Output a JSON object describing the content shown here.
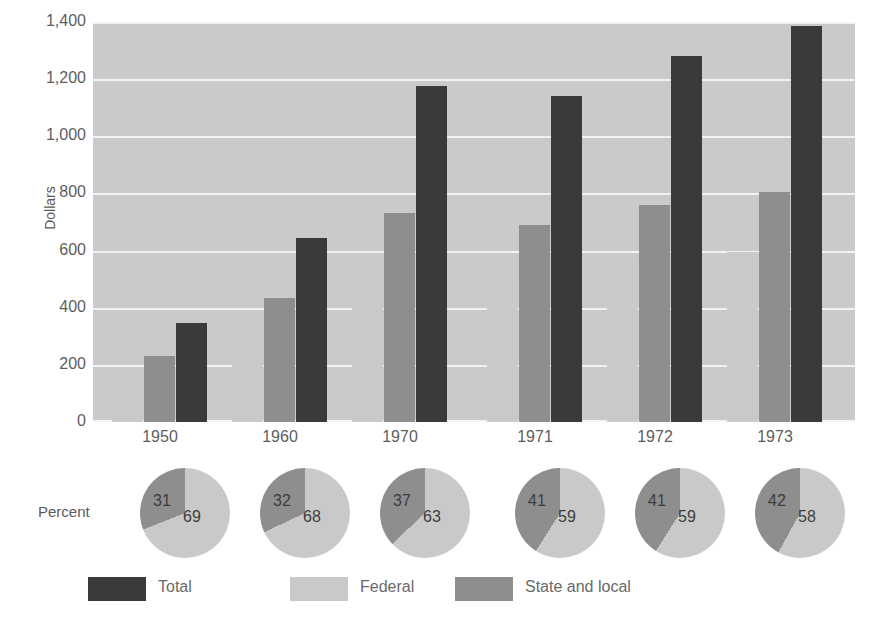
{
  "chart_data": {
    "type": "bar",
    "title": "",
    "xlabel": "",
    "ylabel": "Dollars",
    "ylim": [
      0,
      1400
    ],
    "yticks": [
      "0",
      "200",
      "400",
      "600",
      "800",
      "1,000",
      "1,200",
      "1,400"
    ],
    "ytick_values": [
      0,
      200,
      400,
      600,
      800,
      1000,
      1200,
      1400
    ],
    "grid": true,
    "legend_position": "bottom",
    "categories": [
      "1950",
      "1960",
      "1970",
      "1971",
      "1972",
      "1973"
    ],
    "series": [
      {
        "name": "Federal",
        "color": "#c9c9c9",
        "values": [
          120,
          205,
          440,
          480,
          535,
          595
        ]
      },
      {
        "name": "State and local",
        "color": "#8e8e8e",
        "values": [
          230,
          435,
          730,
          690,
          760,
          805
        ]
      },
      {
        "name": "Total",
        "color": "#3a3a3a",
        "values": [
          345,
          645,
          1175,
          1140,
          1280,
          1385
        ]
      }
    ],
    "pies": {
      "type": "pie",
      "row_label": "Percent",
      "slices": [
        {
          "category": "1950",
          "federal": 69,
          "state_and_local": 31
        },
        {
          "category": "1960",
          "federal": 68,
          "state_and_local": 32
        },
        {
          "category": "1970",
          "federal": 63,
          "state_and_local": 37
        },
        {
          "category": "1971",
          "federal": 59,
          "state_and_local": 41
        },
        {
          "category": "1972",
          "federal": 59,
          "state_and_local": 41
        },
        {
          "category": "1973",
          "federal": 58,
          "state_and_local": 42
        }
      ]
    }
  },
  "axis": {
    "y_title": "Dollars",
    "percent_label": "Percent"
  },
  "legend": {
    "items": [
      {
        "label": "Total",
        "color": "#3a3a3a"
      },
      {
        "label": "Federal",
        "color": "#c9c9c9"
      },
      {
        "label": "State and local",
        "color": "#8e8e8e"
      }
    ]
  },
  "colors": {
    "plot_background": "#cacaca",
    "gridline": "#f2f2f2",
    "page_background": "#ffffff",
    "total": "#3a3a3a",
    "federal": "#c9c9c9",
    "state_and_local": "#8e8e8e",
    "text": "#5d5d5d"
  }
}
